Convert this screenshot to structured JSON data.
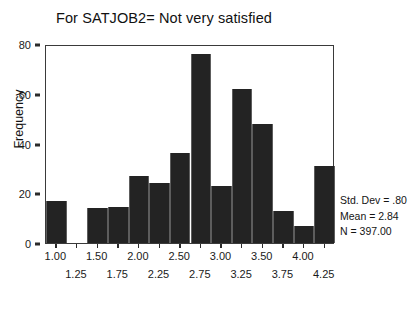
{
  "chart_data": {
    "type": "bar",
    "title": "For SATJOB2= Not very satisfied",
    "xlabel": "",
    "ylabel": "Frequency",
    "ylim": [
      0,
      80
    ],
    "yticks": [
      0,
      20,
      40,
      60,
      80
    ],
    "ytick_labels": [
      "0",
      "20",
      "40",
      "60",
      "80"
    ],
    "xlim": [
      0.875,
      4.375
    ],
    "grid": false,
    "legend": "none",
    "bin_width": 0.25,
    "categories": [
      "1.00",
      "1.25",
      "1.50",
      "1.75",
      "2.00",
      "2.25",
      "2.50",
      "2.75",
      "3.00",
      "3.25",
      "3.50",
      "3.75",
      "4.00",
      "4.25"
    ],
    "values": [
      17,
      0,
      14,
      14.5,
      27,
      24,
      36,
      76,
      23,
      62,
      48,
      13,
      7,
      31
    ],
    "xtick_labels_upper": [
      "1.00",
      "1.50",
      "2.00",
      "2.50",
      "3.00",
      "3.50",
      "4.00"
    ],
    "xtick_labels_lower": [
      "1.25",
      "1.75",
      "2.25",
      "2.75",
      "3.25",
      "3.75",
      "4.25"
    ],
    "annotations": [
      "Std. Dev = .80",
      "Mean = 2.84",
      "N = 397.00"
    ],
    "bar_color": "#232323",
    "axis_color": "#3a3a3a"
  },
  "stats": {
    "std_dev": "Std. Dev = .80",
    "mean": "Mean = 2.84",
    "n": "N = 397.00"
  }
}
